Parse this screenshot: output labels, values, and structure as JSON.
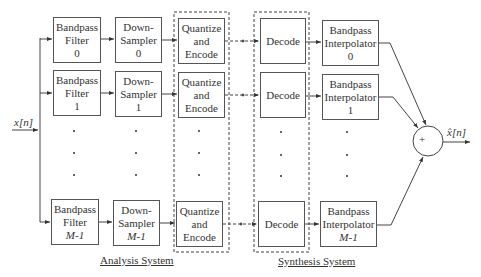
{
  "input_label": "x[n]",
  "output_label": "x̂[n]",
  "adder_symbol": "+",
  "groups": {
    "analysis": "Analysis System",
    "synthesis": "Synthesis System"
  },
  "rows": [
    {
      "filter": {
        "line1": "Bandpass",
        "line2": "Filter",
        "index": "0"
      },
      "sampler": {
        "line1": "Down-",
        "line2": "Sampler",
        "index": "0"
      },
      "quantizer": {
        "line1": "Quantize",
        "line2": "and",
        "line3": "Encode"
      },
      "decoder": {
        "label": "Decode"
      },
      "interpolator": {
        "line1": "Bandpass",
        "line2": "Interpolator",
        "index": "0"
      }
    },
    {
      "filter": {
        "line1": "Bandpass",
        "line2": "Filter",
        "index": "1"
      },
      "sampler": {
        "line1": "Down-",
        "line2": "Sampler",
        "index": "1"
      },
      "quantizer": {
        "line1": "Quantize",
        "line2": "and",
        "line3": "Encode"
      },
      "decoder": {
        "label": "Decode"
      },
      "interpolator": {
        "line1": "Bandpass",
        "line2": "Interpolator",
        "index": "1"
      }
    },
    {
      "filter": {
        "line1": "Bandpass",
        "line2": "Filter",
        "index": "M-1"
      },
      "sampler": {
        "line1": "Down-",
        "line2": "Sampler",
        "index": "M-1"
      },
      "quantizer": {
        "line1": "Quantize",
        "line2": "and",
        "line3": "Encode"
      },
      "decoder": {
        "label": "Decode"
      },
      "interpolator": {
        "line1": "Bandpass",
        "line2": "Interpolator",
        "index": "M-1"
      }
    }
  ]
}
